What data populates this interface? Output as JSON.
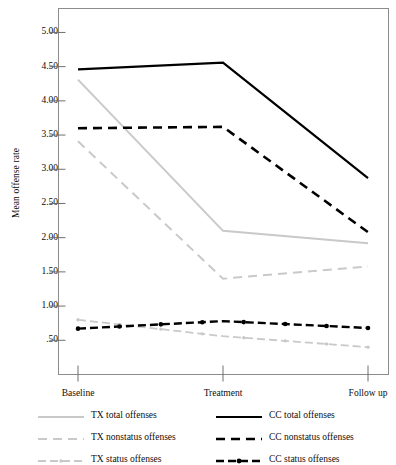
{
  "chart_data": {
    "type": "line",
    "title": "",
    "subtitle": "",
    "xlabel": "",
    "ylabel": "Mean offense rate",
    "categories": [
      "Baseline",
      "Treatment",
      "Follow up"
    ],
    "ylim": [
      0.0,
      5.35
    ],
    "yticks": [
      0.5,
      1.0,
      1.5,
      2.0,
      2.5,
      3.0,
      3.5,
      4.0,
      4.5,
      5.0
    ],
    "ytick_labels": [
      ".50",
      "1.00",
      "1.50",
      "2.00",
      "2.50",
      "3.00",
      "3.50",
      "4.00",
      "4.50",
      "5.00"
    ],
    "grid": false,
    "legend_position": "below",
    "series": [
      {
        "name": "TX  total offenses",
        "group": "TX",
        "measure": "total offenses",
        "values": [
          4.31,
          2.1,
          1.92
        ],
        "color": "#c9c9c9",
        "style": "solid",
        "markers": false,
        "width": 2.0
      },
      {
        "name": "TX  nonstatus offenses",
        "group": "TX",
        "measure": "nonstatus offenses",
        "values": [
          3.41,
          1.4,
          1.58
        ],
        "color": "#c9c9c9",
        "style": "dashed",
        "markers": false,
        "width": 2.0
      },
      {
        "name": "TX  status offenses",
        "group": "TX",
        "measure": "status offenses",
        "values": [
          0.8,
          0.56,
          0.4
        ],
        "color": "#c9c9c9",
        "style": "dash-dot",
        "markers": true,
        "width": 1.8
      },
      {
        "name": "CC  total offenses",
        "group": "CC",
        "measure": "total offenses",
        "values": [
          4.46,
          4.56,
          2.87
        ],
        "color": "#000000",
        "style": "solid",
        "markers": false,
        "width": 2.2
      },
      {
        "name": "CC  nonstatus offenses",
        "group": "CC",
        "measure": "nonstatus offenses",
        "values": [
          3.6,
          3.62,
          2.08
        ],
        "color": "#000000",
        "style": "dashed",
        "markers": false,
        "width": 2.6
      },
      {
        "name": "CC  status offenses",
        "group": "CC",
        "measure": "status offenses",
        "values": [
          0.67,
          0.78,
          0.68
        ],
        "color": "#000000",
        "style": "dash-dot",
        "markers": true,
        "width": 2.4
      }
    ]
  },
  "legend": {
    "left_column": [
      {
        "label": "TX  total offenses",
        "series_index": 0
      },
      {
        "label": "TX  nonstatus offenses",
        "series_index": 1
      },
      {
        "label": "TX  status offenses",
        "series_index": 2
      }
    ],
    "right_column": [
      {
        "label": "CC  total offenses",
        "series_index": 3
      },
      {
        "label": "CC  nonstatus offenses",
        "series_index": 4
      },
      {
        "label": "CC  status offenses",
        "series_index": 5
      }
    ]
  },
  "colors": {
    "tx": "#c9c9c9",
    "cc": "#000000",
    "frame": "#8c8c8c",
    "background": "#ffffff",
    "text": "#0d0d0d"
  }
}
